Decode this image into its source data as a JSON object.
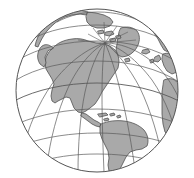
{
  "figure": {
    "kind": "globe-orthographic-projection",
    "title": "World globe, Americas-centered orthographic projection",
    "width_px": 194,
    "height_px": 178
  },
  "colors": {
    "background": "#ffffff",
    "ocean": "#ffffff",
    "land_fill": "#a9a9a9",
    "land_stroke": "#4a4a4a",
    "graticule": "#5a5a5a",
    "limb": "#555555"
  },
  "globe": {
    "center_x": 97,
    "center_y": 90.5,
    "radius_x": 81,
    "radius_y": 81.5,
    "limb_stroke_width": 1.0,
    "pole_x": 105,
    "pole_y": 43,
    "projection_center_lat": 40,
    "projection_center_lon": -70
  },
  "graticule": {
    "enabled": true,
    "meridian_spacing_deg": 30,
    "parallel_spacing_deg": 20,
    "stroke_width": 0.7,
    "north_pole_visible": true,
    "meridian_labels": [
      "-180",
      "-150",
      "-120",
      "-90",
      "-60",
      "-30",
      "0",
      "30"
    ],
    "parallel_labels": [
      "80",
      "60",
      "40",
      "20",
      "0",
      "-20",
      "-40",
      "-60"
    ]
  },
  "landmasses": [
    {
      "name": "north-america",
      "label": "North America"
    },
    {
      "name": "greenland",
      "label": "Greenland"
    },
    {
      "name": "south-america",
      "label": "South America"
    },
    {
      "name": "central-america",
      "label": "Central America"
    },
    {
      "name": "caribbean-islands",
      "label": "Caribbean Islands"
    },
    {
      "name": "europe-west",
      "label": "Western Europe"
    },
    {
      "name": "africa-northwest",
      "label": "Northwest Africa"
    },
    {
      "name": "siberia-northeast",
      "label": "Northeast Siberia"
    },
    {
      "name": "arctic-islands",
      "label": "Canadian Arctic Archipelago"
    },
    {
      "name": "iceland",
      "label": "Iceland"
    },
    {
      "name": "british-isles",
      "label": "British Isles"
    },
    {
      "name": "scandinavia",
      "label": "Scandinavia"
    }
  ],
  "annotations": {
    "none": ""
  }
}
